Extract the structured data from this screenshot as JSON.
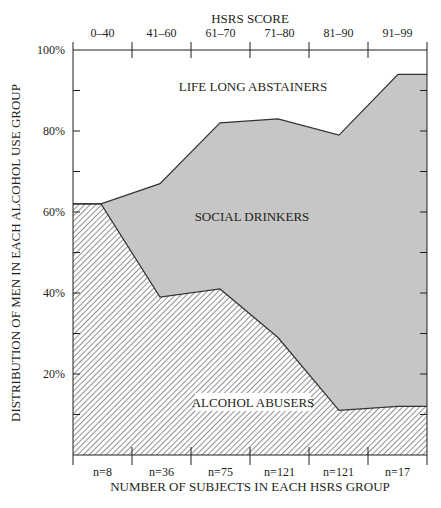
{
  "chart_data": {
    "type": "area",
    "stacked": true,
    "title": "HSRS SCORE",
    "xlabel": "NUMBER OF SUBJECTS IN EACH HSRS GROUP",
    "ylabel": "DISTRIBUTION OF MEN IN EACH ALCOHOL USE GROUP",
    "categories": [
      "0–40",
      "41–60",
      "61–70",
      "71–80",
      "81–90",
      "91–99"
    ],
    "subject_counts": [
      "n=8",
      "n=36",
      "n=75",
      "n=121",
      "n=121",
      "n=17"
    ],
    "y_ticks": [
      "100%",
      "80%",
      "60%",
      "40%",
      "20%"
    ],
    "ylim": [
      0,
      100
    ],
    "grid": false,
    "boundaries": {
      "x": [
        "0–40 (start)",
        "0–40",
        "41–60",
        "61–70",
        "71–80",
        "81–90",
        "91–99",
        "91–99 (end)"
      ],
      "abusers_upper_pct": [
        62,
        62,
        39,
        41,
        29,
        11,
        12,
        12
      ],
      "drinkers_upper_pct": [
        62,
        62,
        67,
        82,
        83,
        79,
        94,
        94
      ]
    },
    "series": [
      {
        "name": "ALCOHOL ABUSERS",
        "values": [
          62,
          39,
          41,
          29,
          11,
          12
        ],
        "fill": "hatched"
      },
      {
        "name": "SOCIAL DRINKERS",
        "values": [
          0,
          28,
          41,
          54,
          68,
          82
        ],
        "fill": "#c6c6c6"
      },
      {
        "name": "LIFE LONG ABSTAINERS",
        "values": [
          38,
          33,
          18,
          17,
          21,
          6
        ],
        "fill": "#ffffff"
      }
    ],
    "legend": "inline labels inside areas",
    "colors": {
      "social_drinkers": "#c6c6c6",
      "axis": "#231f20",
      "hatch": "#555555"
    }
  },
  "labels": {
    "top_title": "HSRS SCORE",
    "bottom_title": "NUMBER OF SUBJECTS IN EACH HSRS GROUP",
    "y_title": "DISTRIBUTION OF MEN IN EACH ALCOHOL USE GROUP",
    "area_abstainers": "LIFE LONG ABSTAINERS",
    "area_drinkers": "SOCIAL DRINKERS",
    "area_abusers": "ALCOHOL ABUSERS"
  }
}
